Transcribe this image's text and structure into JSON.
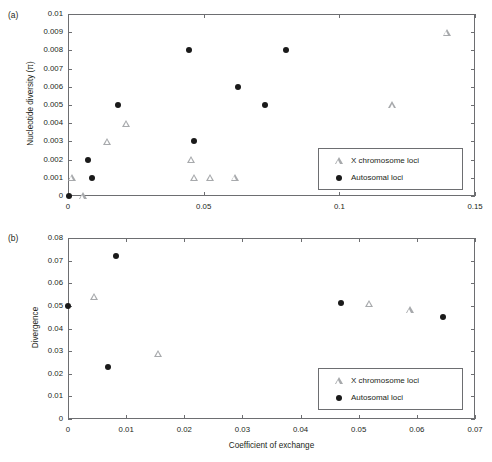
{
  "figure": {
    "background": "#ffffff",
    "marker_colors": {
      "autosomal": "#1a1a1a",
      "x_chromosome": "#a7a9ac",
      "axis": "#6d6e71"
    }
  },
  "panels": [
    {
      "tag": "(a)",
      "chart_data": {
        "type": "scatter",
        "title": "",
        "xlabel": "",
        "ylabel": "Nucleotide diversity (π)",
        "xlim": [
          0,
          0.15
        ],
        "ylim": [
          0,
          0.01
        ],
        "xticks": [
          0,
          0.05,
          0.1,
          0.15
        ],
        "xtick_labels": [
          "0",
          "0.05",
          "0.1",
          "0.15"
        ],
        "yticks": [
          0,
          0.001,
          0.002,
          0.003,
          0.004,
          0.005,
          0.006,
          0.007,
          0.008,
          0.009,
          0.01
        ],
        "ytick_labels": [
          "0",
          "0.001",
          "0.002",
          "0.003",
          "0.004",
          "0.005",
          "0.006",
          "0.007",
          "0.008",
          "0.009",
          "0.01"
        ],
        "grid": false,
        "legend_position": "lower right",
        "series": [
          {
            "name": "X chromosome loci",
            "marker": "triangle-open",
            "color": "#a7a9ac",
            "points": [
              {
                "x": 0.0015,
                "y": 0.001
              },
              {
                "x": 0.0055,
                "y": 0.0
              },
              {
                "x": 0.0145,
                "y": 0.003
              },
              {
                "x": 0.0215,
                "y": 0.004
              },
              {
                "x": 0.0455,
                "y": 0.002
              },
              {
                "x": 0.0465,
                "y": 0.001
              },
              {
                "x": 0.0525,
                "y": 0.001
              },
              {
                "x": 0.0615,
                "y": 0.001
              },
              {
                "x": 0.1195,
                "y": 0.005
              },
              {
                "x": 0.1395,
                "y": 0.009
              }
            ]
          },
          {
            "name": "Autosomal loci",
            "marker": "circle-filled",
            "color": "#1a1a1a",
            "points": [
              {
                "x": 0.0005,
                "y": 0.0
              },
              {
                "x": 0.0075,
                "y": 0.002
              },
              {
                "x": 0.009,
                "y": 0.001
              },
              {
                "x": 0.0185,
                "y": 0.005
              },
              {
                "x": 0.0445,
                "y": 0.008
              },
              {
                "x": 0.0465,
                "y": 0.003
              },
              {
                "x": 0.0625,
                "y": 0.006
              },
              {
                "x": 0.0725,
                "y": 0.005
              },
              {
                "x": 0.0805,
                "y": 0.008
              }
            ]
          }
        ],
        "legend": [
          {
            "label": "X chromosome loci",
            "marker": "triangle-open"
          },
          {
            "label": "Autosomal loci",
            "marker": "circle-filled"
          }
        ]
      }
    },
    {
      "tag": "(b)",
      "chart_data": {
        "type": "scatter",
        "title": "",
        "xlabel": "Coefficient of exchange",
        "ylabel": "Divergence",
        "xlim": [
          0,
          0.07
        ],
        "ylim": [
          0,
          0.08
        ],
        "xticks": [
          0,
          0.01,
          0.02,
          0.03,
          0.04,
          0.05,
          0.06,
          0.07
        ],
        "xtick_labels": [
          "0",
          "0.01",
          "0.02",
          "0.03",
          "0.04",
          "0.05",
          "0.06",
          "0.07"
        ],
        "yticks": [
          0,
          0.01,
          0.02,
          0.03,
          0.04,
          0.05,
          0.06,
          0.07,
          0.08
        ],
        "ytick_labels": [
          "0",
          "0.01",
          "0.02",
          "0.03",
          "0.04",
          "0.05",
          "0.06",
          "0.07",
          "0.08"
        ],
        "grid": false,
        "legend_position": "lower right",
        "series": [
          {
            "name": "X chromosome loci",
            "marker": "triangle-open",
            "color": "#a7a9ac",
            "points": [
              {
                "x": 0.0045,
                "y": 0.054
              },
              {
                "x": 0.0155,
                "y": 0.029
              },
              {
                "x": 0.0518,
                "y": 0.0512
              },
              {
                "x": 0.0588,
                "y": 0.0482
              }
            ]
          },
          {
            "name": "Autosomal loci",
            "marker": "circle-filled",
            "color": "#1a1a1a",
            "points": [
              {
                "x": 0.0,
                "y": 0.05
              },
              {
                "x": 0.0068,
                "y": 0.023
              },
              {
                "x": 0.0082,
                "y": 0.072
              },
              {
                "x": 0.047,
                "y": 0.0512
              },
              {
                "x": 0.0645,
                "y": 0.045
              }
            ]
          }
        ],
        "legend": [
          {
            "label": "X chromosome loci",
            "marker": "triangle-open"
          },
          {
            "label": "Autosomal loci",
            "marker": "circle-filled"
          }
        ]
      }
    }
  ]
}
